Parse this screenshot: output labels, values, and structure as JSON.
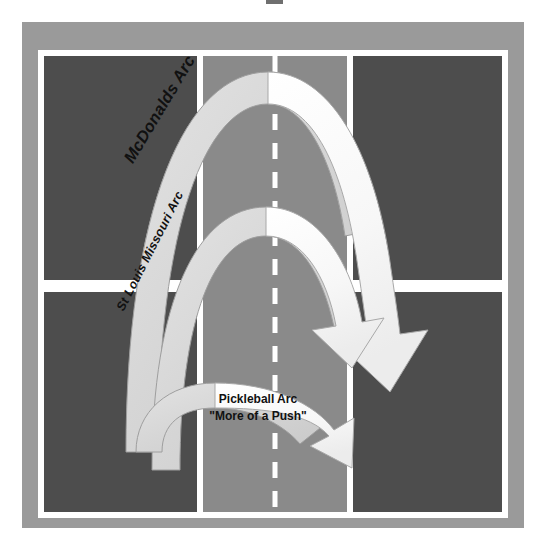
{
  "figure": {
    "background_color": "#ffffff",
    "surround_color": "#9a9a9a",
    "court_color": "#4d4d4d",
    "kitchen_color": "#8a8a8a",
    "line_color": "#ffffff",
    "arc_light_color": "#d9d9d9",
    "arc_white_color": "#fafafa",
    "arc_outline_color": "#808080",
    "text_color": "#111111"
  },
  "court": {
    "surround": {
      "x": 22,
      "y": 22,
      "width": 502,
      "height": 506
    },
    "playing_area": {
      "x": 38,
      "y": 50,
      "width": 470,
      "height": 468
    },
    "line_width": 6,
    "kitchen": {
      "x": 200,
      "y": 50,
      "width": 150,
      "height": 468
    },
    "center_line_dashed": true,
    "center_line_x": 275,
    "service_line_y": 286
  },
  "arcs": [
    {
      "id": "mcdonalds",
      "label": "McDonalds Arc",
      "description": "Highest, steepest arc",
      "fill": "#d9d9d9",
      "peak_y": 72,
      "start_x": 128,
      "end_x": 380,
      "label_rotation_deg": -59,
      "label_font_size": 16.5
    },
    {
      "id": "stlouis",
      "label": "St Louis Missouri Arc",
      "description": "Medium height arc",
      "fill": "#d9d9d9",
      "peak_y": 207,
      "start_x": 152,
      "end_x": 372,
      "label_rotation_deg": -63,
      "label_font_size": 12.5
    },
    {
      "id": "pickleball",
      "label_line1": "Pickleball Arc",
      "label_line2": "\"More of a Push\"",
      "description": "Low flat arc",
      "fill": "#d9d9d9",
      "peak_y": 383,
      "start_x": 140,
      "end_x": 364,
      "label_font_size": 12
    }
  ],
  "arrowheads": [
    {
      "id": "mcdonalds-arrowhead",
      "tip_x": 388,
      "tip_y": 380
    },
    {
      "id": "stlouis-arrowhead",
      "tip_x": 364,
      "tip_y": 368
    },
    {
      "id": "pickleball-arrowhead",
      "tip_x": 368,
      "tip_y": 452
    }
  ]
}
